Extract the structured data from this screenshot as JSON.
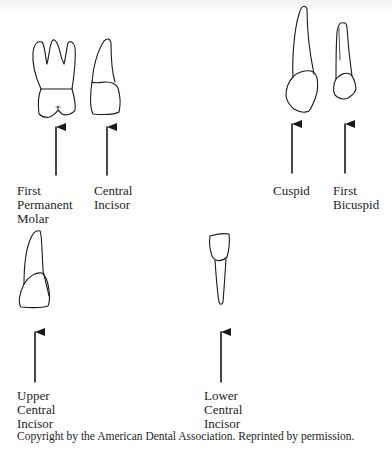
{
  "figure": {
    "type": "dental tooth identification diagram",
    "teeth": [
      {
        "id": "first-permanent-molar",
        "label": "First\nPermanent\nMolar",
        "icon": "molar-tooth-icon"
      },
      {
        "id": "central-incisor",
        "label": "Central\nIncisor",
        "icon": "incisor-tooth-icon"
      },
      {
        "id": "cuspid",
        "label": "Cuspid",
        "icon": "cuspid-tooth-icon"
      },
      {
        "id": "first-bicuspid",
        "label": "First\nBicuspid",
        "icon": "bicuspid-tooth-icon"
      },
      {
        "id": "upper-central-incisor",
        "label": "Upper\nCentral\nIncisor",
        "icon": "upper-incisor-tooth-icon"
      },
      {
        "id": "lower-central-incisor",
        "label": "Lower\nCentral\nIncisor",
        "icon": "lower-incisor-tooth-icon"
      }
    ],
    "caption": "Copyright by the American Dental Association. Reprinted by permission.",
    "colors": {
      "line": "#1a1a1a",
      "background": "#ffffff"
    }
  }
}
